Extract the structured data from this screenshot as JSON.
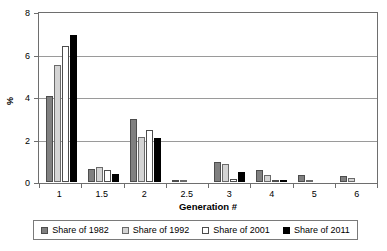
{
  "chart_data": {
    "type": "bar",
    "title": "",
    "xlabel": "Generation #",
    "ylabel": "%",
    "categories": [
      "1",
      "1.5",
      "2",
      "2.5",
      "3",
      "4",
      "5",
      "6"
    ],
    "ylim": [
      0,
      8
    ],
    "yticks": [
      0,
      2,
      4,
      6,
      8
    ],
    "ytick_labels": [
      "0",
      "2",
      "4",
      "6",
      "8"
    ],
    "grid": true,
    "legend_position": "bottom",
    "series": [
      {
        "name": "Share of 1982",
        "color": "#808080",
        "values": [
          4.05,
          0.6,
          2.95,
          0.05,
          0.92,
          0.55,
          0.35,
          0.27
        ]
      },
      {
        "name": "Share of 1992",
        "color": "#d4d4d4",
        "values": [
          5.5,
          0.7,
          2.1,
          0.03,
          0.85,
          0.32,
          0.1,
          0.17
        ]
      },
      {
        "name": "Share of 2001",
        "color": "#ffffff",
        "values": [
          6.4,
          0.55,
          2.45,
          0.0,
          0.12,
          0.05,
          0.0,
          0.0
        ]
      },
      {
        "name": "Share of 2011",
        "color": "#000000",
        "values": [
          6.9,
          0.38,
          2.08,
          0.0,
          0.45,
          0.1,
          0.0,
          0.0
        ]
      }
    ]
  }
}
